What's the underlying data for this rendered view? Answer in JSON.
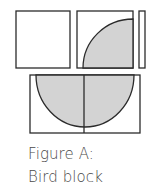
{
  "figure": {
    "caption_line1": "Figure A:",
    "caption_line2": "Bird block",
    "stroke_color": "#2b2b2b",
    "fill_color": "#d3d3d3"
  }
}
